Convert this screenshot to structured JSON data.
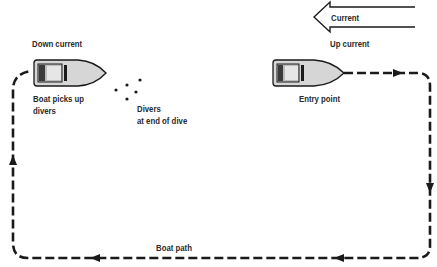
{
  "diagram": {
    "type": "dive-boat-pickup-pattern",
    "current_arrow": {
      "label": "Current",
      "direction": "left"
    },
    "labels": {
      "down_current": "Down current",
      "up_current": "Up current",
      "boat_picks_up_line1": "Boat picks up",
      "boat_picks_up_line2": "divers",
      "divers_line1": "Divers",
      "divers_line2": "at end of dive",
      "entry_point": "Entry point",
      "boat_path": "Boat path"
    },
    "colors": {
      "line": "#1a1a1a",
      "boat_fill": "#d6d6d6",
      "background": "#ffffff"
    }
  }
}
